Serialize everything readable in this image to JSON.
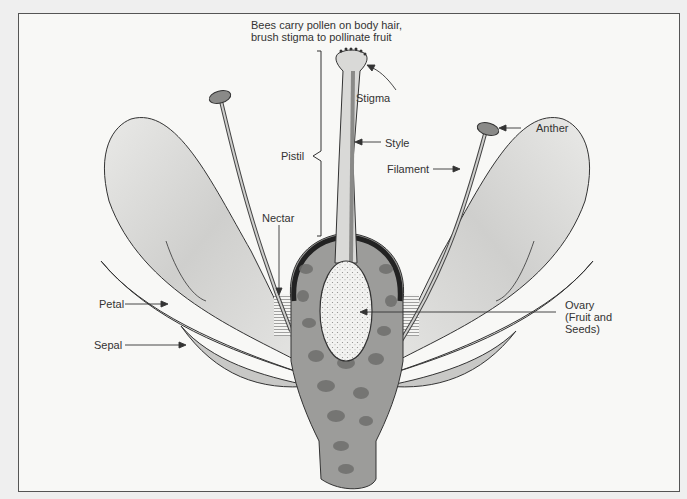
{
  "diagram": {
    "caption": {
      "line1": "Bees carry pollen on body hair,",
      "line2": "brush stigma to pollinate fruit"
    },
    "labels": {
      "stigma": "Stigma",
      "style": "Style",
      "pistil": "Pistil",
      "anther": "Anther",
      "filament": "Filament",
      "nectar": "Nectar",
      "petal": "Petal",
      "sepal": "Sepal",
      "ovary_line1": "Ovary",
      "ovary_line2": "(Fruit and",
      "ovary_line3": "Seeds)"
    },
    "colors": {
      "background": "#f8f8f6",
      "outline": "#333333",
      "petal_fill": "#d6d6d4",
      "receptacle_fill": "#9a9a98",
      "spots": "#6f6f6d",
      "ovary_fill": "#ececea",
      "text": "#333333"
    }
  }
}
